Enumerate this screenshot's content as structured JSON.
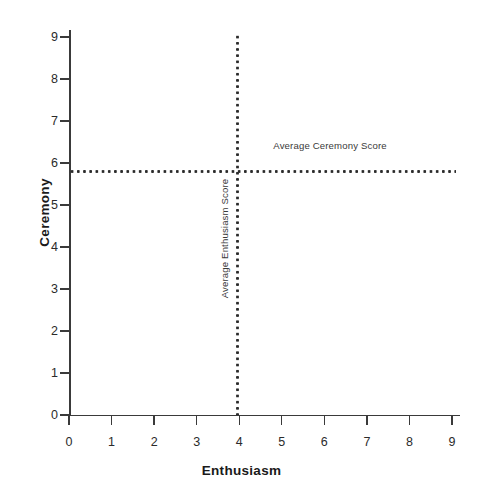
{
  "chart_data": {
    "type": "scatter",
    "title": "",
    "xlabel": "Enthusiasm",
    "ylabel": "Ceremony",
    "xlim": [
      0,
      9
    ],
    "ylim": [
      0,
      9
    ],
    "xticks": [
      0,
      1,
      2,
      3,
      4,
      5,
      6,
      7,
      8,
      9
    ],
    "yticks": [
      0,
      1,
      2,
      3,
      4,
      5,
      6,
      7,
      8,
      9
    ],
    "xtick_labels": [
      "0",
      "1",
      "2",
      "3",
      "4",
      "5",
      "6",
      "7",
      "8",
      "9"
    ],
    "ytick_labels": [
      "0",
      "1",
      "2",
      "3",
      "4",
      "5",
      "6",
      "7",
      "8",
      "9"
    ],
    "grid": false,
    "legend": null,
    "series": [
      {
        "name": "Responses",
        "x": [],
        "y": [],
        "note": "no visible data points plotted"
      }
    ],
    "reference_lines": [
      {
        "name": "Average Ceremony Score",
        "orientation": "horizontal",
        "value": 5.8,
        "style": "dotted",
        "color": "#2b2b2b",
        "label": "Average Ceremony Score",
        "label_position": "above-right"
      },
      {
        "name": "Average Enthusiasm Score",
        "orientation": "vertical",
        "value": 3.96,
        "style": "dotted",
        "color": "#2b2b2b",
        "label": "Average Enthusiasm Score",
        "label_position": "rotated-left-of-line"
      }
    ],
    "annotations": [
      {
        "text": "Average Ceremony Score",
        "x": 4.8,
        "y": 6.4,
        "rotation": 0
      },
      {
        "text": "Average Enthusiasm Score",
        "x": 3.72,
        "y": 4.2,
        "rotation": 90
      }
    ],
    "colors": {
      "axis": "#3a3a3a",
      "text": "#1a1a1a",
      "reference_line": "#2b2b2b",
      "background": "#ffffff"
    }
  }
}
